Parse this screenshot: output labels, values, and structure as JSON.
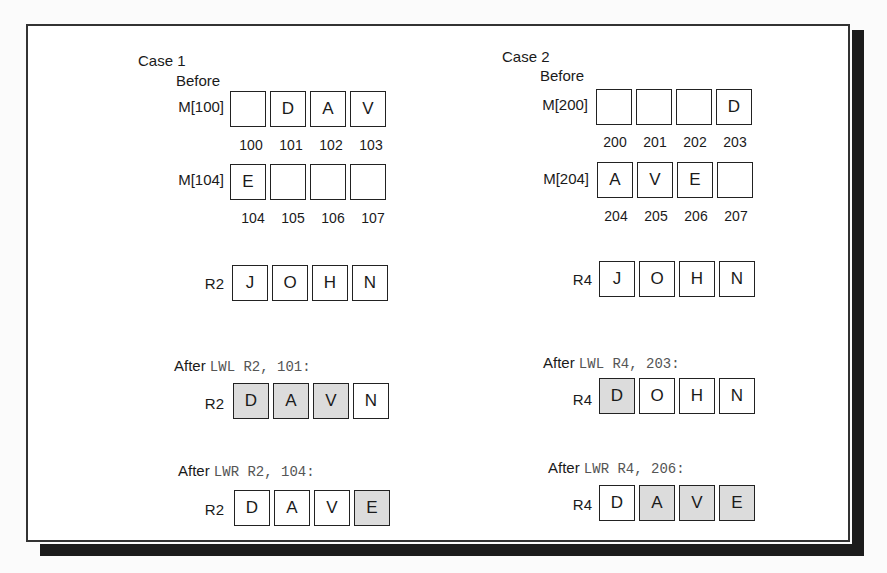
{
  "colors": {
    "shaded_cell": "#dcdcdc",
    "frame": "#333333",
    "shadow": "#1c1c1c"
  },
  "case1": {
    "title": "Case 1",
    "before_label": "Before",
    "memory": [
      {
        "label": "M[100]",
        "cells": [
          "",
          "D",
          "A",
          "V"
        ],
        "addresses": [
          "100",
          "101",
          "102",
          "103"
        ]
      },
      {
        "label": "M[104]",
        "cells": [
          "E",
          "",
          "",
          ""
        ],
        "addresses": [
          "104",
          "105",
          "106",
          "107"
        ]
      }
    ],
    "register": {
      "label": "R2",
      "cells": [
        "J",
        "O",
        "H",
        "N"
      ]
    },
    "after": [
      {
        "prefix": "After",
        "instruction": "LWL R2, 101:",
        "register": "R2",
        "cells": [
          "D",
          "A",
          "V",
          "N"
        ],
        "shaded": [
          true,
          true,
          true,
          false
        ]
      },
      {
        "prefix": "After",
        "instruction": "LWR R2, 104:",
        "register": "R2",
        "cells": [
          "D",
          "A",
          "V",
          "E"
        ],
        "shaded": [
          false,
          false,
          false,
          true
        ]
      }
    ]
  },
  "case2": {
    "title": "Case 2",
    "before_label": "Before",
    "memory": [
      {
        "label": "M[200]",
        "cells": [
          "",
          "",
          "",
          "D"
        ],
        "addresses": [
          "200",
          "201",
          "202",
          "203"
        ]
      },
      {
        "label": "M[204]",
        "cells": [
          "A",
          "V",
          "E",
          ""
        ],
        "addresses": [
          "204",
          "205",
          "206",
          "207"
        ]
      }
    ],
    "register": {
      "label": "R4",
      "cells": [
        "J",
        "O",
        "H",
        "N"
      ]
    },
    "after": [
      {
        "prefix": "After",
        "instruction": "LWL R4, 203:",
        "register": "R4",
        "cells": [
          "D",
          "O",
          "H",
          "N"
        ],
        "shaded": [
          true,
          false,
          false,
          false
        ]
      },
      {
        "prefix": "After",
        "instruction": "LWR R4, 206:",
        "register": "R4",
        "cells": [
          "D",
          "A",
          "V",
          "E"
        ],
        "shaded": [
          false,
          true,
          true,
          true
        ]
      }
    ]
  }
}
